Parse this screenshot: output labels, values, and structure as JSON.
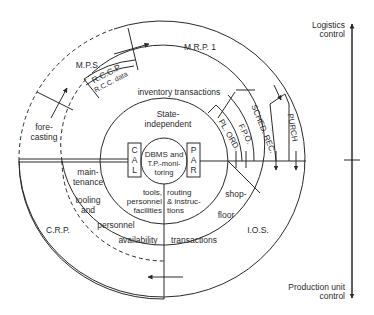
{
  "diagram": {
    "axis": {
      "top_label_line1": "Logistics",
      "top_label_line2": "control",
      "bottom_label_line1": "Production unit",
      "bottom_label_line2": "control"
    },
    "rings": {
      "outer_top": "M.R.P. 1",
      "outer_left_top": "M.P.S.",
      "outer_left": "C.R.P.",
      "outer_right": "I.O.S.",
      "forecasting_1": "fore-",
      "forecasting_2": "casting",
      "rccp": "R.C.C.P.",
      "rcc_data": "R.C.C. data",
      "purch": "PURCH",
      "sched_rec": "SCHED. REC.",
      "fpo": "F.P.O.",
      "pl_ord": "PL. ORD.",
      "inventory": "inventory transactions",
      "maintenance_1": "main-",
      "maintenance_2": "tenance",
      "tooling_1": "tooling",
      "tooling_2": "and",
      "personnel": "personnel",
      "availability": "availability",
      "transactions": "transactions",
      "shop": "shop-",
      "floor": "floor"
    },
    "inner": {
      "state_1": "State-",
      "state_2": "independent",
      "cal": [
        "C",
        "A",
        "L"
      ],
      "par": [
        "P",
        "A",
        "R"
      ],
      "core_1": "DBMS and",
      "core_2": "T.P.-moni-",
      "core_3": "toring",
      "tools_1": "tools,",
      "tools_2": "personnel",
      "tools_3": "facilities",
      "routing_1": "routing",
      "routing_2": "& instruc-",
      "routing_3": "tions"
    },
    "colors": {
      "line": "#2a2a2a",
      "background": "#ffffff"
    }
  }
}
